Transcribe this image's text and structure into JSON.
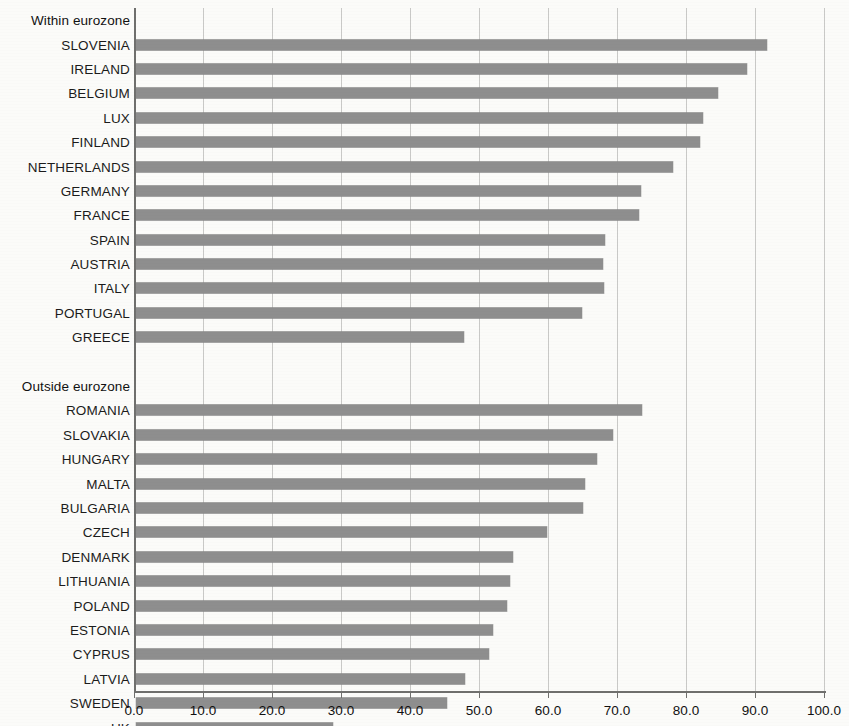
{
  "chart_data": {
    "type": "bar",
    "orientation": "horizontal",
    "title": "",
    "xlabel": "",
    "ylabel": "",
    "xlim": [
      0.0,
      100.0
    ],
    "xticks": [
      "0.0",
      "10.0",
      "20.0",
      "30.0",
      "40.0",
      "50.0",
      "60.0",
      "70.0",
      "80.0",
      "90.0",
      "100.0"
    ],
    "xtick_values": [
      0,
      10,
      20,
      30,
      40,
      50,
      60,
      70,
      80,
      90,
      100
    ],
    "grid": "vertical",
    "legend": "none",
    "bar_color": "#8e8e8e",
    "groups": [
      {
        "heading": "Within eurozone",
        "categories": [
          "SLOVENIA",
          "IRELAND",
          "BELGIUM",
          "LUX",
          "FINLAND",
          "NETHERLANDS",
          "GERMANY",
          "FRANCE",
          "SPAIN",
          "AUSTRIA",
          "ITALY",
          "PORTUGAL",
          "GREECE"
        ],
        "values": [
          91.4,
          88.6,
          84.3,
          82.2,
          81.8,
          77.8,
          73.2,
          72.9,
          68.0,
          67.7,
          67.8,
          64.7,
          47.5
        ]
      },
      {
        "heading": "Outside eurozone",
        "categories": [
          "ROMANIA",
          "SLOVAKIA",
          "HUNGARY",
          "MALTA",
          "BULGARIA",
          "CZECH",
          "DENMARK",
          "LITHUANIA",
          "POLAND",
          "ESTONIA",
          "CYPRUS",
          "LATVIA",
          "SWEDEN",
          "UK"
        ],
        "values": [
          73.4,
          69.2,
          66.8,
          65.0,
          64.8,
          59.5,
          54.7,
          54.2,
          53.8,
          51.8,
          51.1,
          47.7,
          45.1,
          28.6
        ]
      }
    ]
  },
  "rows": [
    {
      "label": "Within eurozone",
      "kind": "heading",
      "value": null
    },
    {
      "label": "SLOVENIA",
      "kind": "bar",
      "value": 91.4
    },
    {
      "label": "IRELAND",
      "kind": "bar",
      "value": 88.6
    },
    {
      "label": "BELGIUM",
      "kind": "bar",
      "value": 84.3
    },
    {
      "label": "LUX",
      "kind": "bar",
      "value": 82.2
    },
    {
      "label": "FINLAND",
      "kind": "bar",
      "value": 81.8
    },
    {
      "label": "NETHERLANDS",
      "kind": "bar",
      "value": 77.8
    },
    {
      "label": "GERMANY",
      "kind": "bar",
      "value": 73.2
    },
    {
      "label": "FRANCE",
      "kind": "bar",
      "value": 72.9
    },
    {
      "label": "SPAIN",
      "kind": "bar",
      "value": 68.0
    },
    {
      "label": "AUSTRIA",
      "kind": "bar",
      "value": 67.7
    },
    {
      "label": "ITALY",
      "kind": "bar",
      "value": 67.8
    },
    {
      "label": "PORTUGAL",
      "kind": "bar",
      "value": 64.7
    },
    {
      "label": "GREECE",
      "kind": "bar",
      "value": 47.5
    },
    {
      "label": "",
      "kind": "spacer",
      "value": null
    },
    {
      "label": "Outside eurozone",
      "kind": "heading",
      "value": null
    },
    {
      "label": "ROMANIA",
      "kind": "bar",
      "value": 73.4
    },
    {
      "label": "SLOVAKIA",
      "kind": "bar",
      "value": 69.2
    },
    {
      "label": "HUNGARY",
      "kind": "bar",
      "value": 66.8
    },
    {
      "label": "MALTA",
      "kind": "bar",
      "value": 65.0
    },
    {
      "label": "BULGARIA",
      "kind": "bar",
      "value": 64.8
    },
    {
      "label": "CZECH",
      "kind": "bar",
      "value": 59.5
    },
    {
      "label": "DENMARK",
      "kind": "bar",
      "value": 54.7
    },
    {
      "label": "LITHUANIA",
      "kind": "bar",
      "value": 54.2
    },
    {
      "label": "POLAND",
      "kind": "bar",
      "value": 53.8
    },
    {
      "label": "ESTONIA",
      "kind": "bar",
      "value": 51.8
    },
    {
      "label": "CYPRUS",
      "kind": "bar",
      "value": 51.1
    },
    {
      "label": "LATVIA",
      "kind": "bar",
      "value": 47.7
    },
    {
      "label": "SWEDEN",
      "kind": "bar",
      "value": 45.1
    },
    {
      "label": "UK",
      "kind": "bar",
      "value": 28.6
    }
  ]
}
